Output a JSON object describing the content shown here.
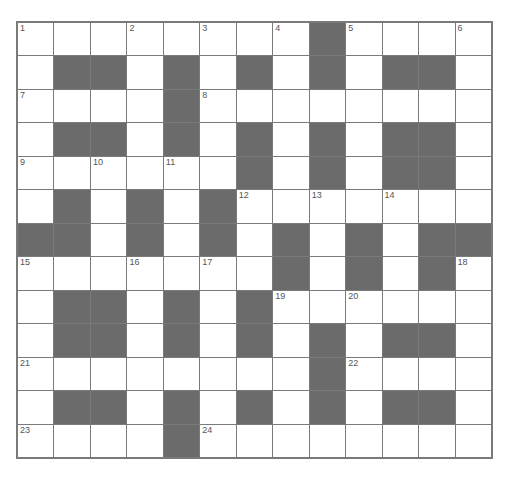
{
  "puzzle": {
    "rows": 13,
    "cols": 13,
    "colors": {
      "black": "#6b6b6b",
      "white": "#ffffff",
      "line": "#7a7a7a",
      "number": "#555555"
    },
    "grid": [
      "WWWWWWWWBWWWW",
      "WBBWBWBWBWBBW",
      "WWWWBWWWWWWWW",
      "WBBWBWBWBWBBW",
      "WWWWWWBWBWBBW",
      "WBWBWBWWWWWWW",
      "BBWBWBWBWBWBB",
      "WWWWWWWBWBWBW",
      "WBBWBWBWWWWWW",
      "WBBWBWBWBWBBW",
      "WWWWWWWWBWWWW",
      "WBBWBWBWBWBBW",
      "WWWWBWWWWWWWW"
    ],
    "numbers": [
      {
        "r": 0,
        "c": 0,
        "n": "1"
      },
      {
        "r": 0,
        "c": 3,
        "n": "2"
      },
      {
        "r": 0,
        "c": 5,
        "n": "3"
      },
      {
        "r": 0,
        "c": 7,
        "n": "4"
      },
      {
        "r": 0,
        "c": 9,
        "n": "5"
      },
      {
        "r": 0,
        "c": 12,
        "n": "6"
      },
      {
        "r": 2,
        "c": 0,
        "n": "7"
      },
      {
        "r": 2,
        "c": 5,
        "n": "8"
      },
      {
        "r": 4,
        "c": 0,
        "n": "9"
      },
      {
        "r": 4,
        "c": 2,
        "n": "10"
      },
      {
        "r": 4,
        "c": 4,
        "n": "11"
      },
      {
        "r": 5,
        "c": 6,
        "n": "12"
      },
      {
        "r": 5,
        "c": 8,
        "n": "13"
      },
      {
        "r": 5,
        "c": 10,
        "n": "14"
      },
      {
        "r": 7,
        "c": 0,
        "n": "15"
      },
      {
        "r": 7,
        "c": 3,
        "n": "16"
      },
      {
        "r": 7,
        "c": 5,
        "n": "17"
      },
      {
        "r": 7,
        "c": 12,
        "n": "18"
      },
      {
        "r": 8,
        "c": 7,
        "n": "19"
      },
      {
        "r": 8,
        "c": 9,
        "n": "20"
      },
      {
        "r": 10,
        "c": 0,
        "n": "21"
      },
      {
        "r": 10,
        "c": 9,
        "n": "22"
      },
      {
        "r": 12,
        "c": 0,
        "n": "23"
      },
      {
        "r": 12,
        "c": 5,
        "n": "24"
      }
    ],
    "entries": [
      "",
      "",
      "",
      "",
      "",
      "",
      "",
      "",
      "",
      "",
      "",
      "",
      ""
    ]
  }
}
